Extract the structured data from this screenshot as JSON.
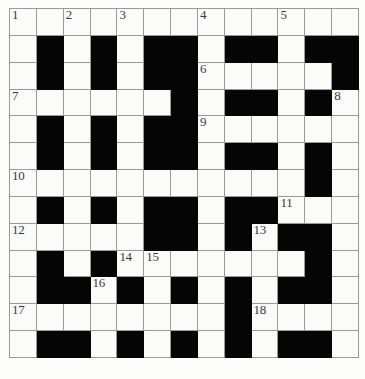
{
  "diagram": {
    "kind": "crossword-grid",
    "columns": 13,
    "rows": 13,
    "colors": {
      "block": "#050505",
      "cell": "#fbfbfa",
      "grid_line": "#9a9a9a",
      "number_text": "#3a3a3a",
      "page_background": "#ffffff"
    },
    "legend": {
      "block_label": "blocked square",
      "open_label": "open square"
    },
    "clue_numbers": [
      1,
      2,
      3,
      4,
      5,
      6,
      7,
      8,
      9,
      10,
      11,
      12,
      13,
      14,
      15,
      16,
      17,
      18
    ],
    "cells": [
      [
        {
          "block": false,
          "num": "1"
        },
        {
          "block": false,
          "num": ""
        },
        {
          "block": false,
          "num": "2"
        },
        {
          "block": false,
          "num": ""
        },
        {
          "block": false,
          "num": "3"
        },
        {
          "block": false,
          "num": ""
        },
        {
          "block": false,
          "num": ""
        },
        {
          "block": false,
          "num": "4"
        },
        {
          "block": false,
          "num": ""
        },
        {
          "block": false,
          "num": ""
        },
        {
          "block": false,
          "num": "5"
        },
        {
          "block": false,
          "num": ""
        },
        {
          "block": false,
          "num": ""
        }
      ],
      [
        {
          "block": false,
          "num": ""
        },
        {
          "block": true,
          "num": ""
        },
        {
          "block": false,
          "num": ""
        },
        {
          "block": true,
          "num": ""
        },
        {
          "block": false,
          "num": ""
        },
        {
          "block": true,
          "num": ""
        },
        {
          "block": true,
          "num": ""
        },
        {
          "block": false,
          "num": ""
        },
        {
          "block": true,
          "num": ""
        },
        {
          "block": true,
          "num": ""
        },
        {
          "block": false,
          "num": ""
        },
        {
          "block": true,
          "num": ""
        },
        {
          "block": true,
          "num": ""
        }
      ],
      [
        {
          "block": false,
          "num": ""
        },
        {
          "block": true,
          "num": ""
        },
        {
          "block": false,
          "num": ""
        },
        {
          "block": true,
          "num": ""
        },
        {
          "block": false,
          "num": ""
        },
        {
          "block": true,
          "num": ""
        },
        {
          "block": true,
          "num": ""
        },
        {
          "block": false,
          "num": "6"
        },
        {
          "block": false,
          "num": ""
        },
        {
          "block": false,
          "num": ""
        },
        {
          "block": false,
          "num": ""
        },
        {
          "block": false,
          "num": ""
        },
        {
          "block": true,
          "num": ""
        }
      ],
      [
        {
          "block": false,
          "num": "7"
        },
        {
          "block": false,
          "num": ""
        },
        {
          "block": false,
          "num": ""
        },
        {
          "block": false,
          "num": ""
        },
        {
          "block": false,
          "num": ""
        },
        {
          "block": false,
          "num": ""
        },
        {
          "block": true,
          "num": ""
        },
        {
          "block": false,
          "num": ""
        },
        {
          "block": true,
          "num": ""
        },
        {
          "block": true,
          "num": ""
        },
        {
          "block": false,
          "num": ""
        },
        {
          "block": true,
          "num": ""
        },
        {
          "block": false,
          "num": "8"
        }
      ],
      [
        {
          "block": false,
          "num": ""
        },
        {
          "block": true,
          "num": ""
        },
        {
          "block": false,
          "num": ""
        },
        {
          "block": true,
          "num": ""
        },
        {
          "block": false,
          "num": ""
        },
        {
          "block": true,
          "num": ""
        },
        {
          "block": true,
          "num": ""
        },
        {
          "block": false,
          "num": "9"
        },
        {
          "block": false,
          "num": ""
        },
        {
          "block": false,
          "num": ""
        },
        {
          "block": false,
          "num": ""
        },
        {
          "block": false,
          "num": ""
        },
        {
          "block": false,
          "num": ""
        }
      ],
      [
        {
          "block": false,
          "num": ""
        },
        {
          "block": true,
          "num": ""
        },
        {
          "block": false,
          "num": ""
        },
        {
          "block": true,
          "num": ""
        },
        {
          "block": false,
          "num": ""
        },
        {
          "block": true,
          "num": ""
        },
        {
          "block": true,
          "num": ""
        },
        {
          "block": false,
          "num": ""
        },
        {
          "block": true,
          "num": ""
        },
        {
          "block": true,
          "num": ""
        },
        {
          "block": false,
          "num": ""
        },
        {
          "block": true,
          "num": ""
        },
        {
          "block": false,
          "num": ""
        }
      ],
      [
        {
          "block": false,
          "num": "10"
        },
        {
          "block": false,
          "num": ""
        },
        {
          "block": false,
          "num": ""
        },
        {
          "block": false,
          "num": ""
        },
        {
          "block": false,
          "num": ""
        },
        {
          "block": false,
          "num": ""
        },
        {
          "block": false,
          "num": ""
        },
        {
          "block": false,
          "num": ""
        },
        {
          "block": false,
          "num": ""
        },
        {
          "block": false,
          "num": ""
        },
        {
          "block": false,
          "num": ""
        },
        {
          "block": true,
          "num": ""
        },
        {
          "block": false,
          "num": ""
        }
      ],
      [
        {
          "block": false,
          "num": ""
        },
        {
          "block": true,
          "num": ""
        },
        {
          "block": false,
          "num": ""
        },
        {
          "block": true,
          "num": ""
        },
        {
          "block": false,
          "num": ""
        },
        {
          "block": true,
          "num": ""
        },
        {
          "block": true,
          "num": ""
        },
        {
          "block": false,
          "num": ""
        },
        {
          "block": true,
          "num": ""
        },
        {
          "block": true,
          "num": ""
        },
        {
          "block": false,
          "num": "11"
        },
        {
          "block": false,
          "num": ""
        },
        {
          "block": false,
          "num": ""
        }
      ],
      [
        {
          "block": false,
          "num": "12"
        },
        {
          "block": false,
          "num": ""
        },
        {
          "block": false,
          "num": ""
        },
        {
          "block": false,
          "num": ""
        },
        {
          "block": false,
          "num": ""
        },
        {
          "block": true,
          "num": ""
        },
        {
          "block": true,
          "num": ""
        },
        {
          "block": false,
          "num": ""
        },
        {
          "block": true,
          "num": ""
        },
        {
          "block": false,
          "num": "13"
        },
        {
          "block": true,
          "num": ""
        },
        {
          "block": true,
          "num": ""
        },
        {
          "block": false,
          "num": ""
        }
      ],
      [
        {
          "block": false,
          "num": ""
        },
        {
          "block": true,
          "num": ""
        },
        {
          "block": false,
          "num": ""
        },
        {
          "block": true,
          "num": ""
        },
        {
          "block": false,
          "num": "14"
        },
        {
          "block": false,
          "num": "15"
        },
        {
          "block": false,
          "num": ""
        },
        {
          "block": false,
          "num": ""
        },
        {
          "block": false,
          "num": ""
        },
        {
          "block": false,
          "num": ""
        },
        {
          "block": false,
          "num": ""
        },
        {
          "block": true,
          "num": ""
        },
        {
          "block": false,
          "num": ""
        }
      ],
      [
        {
          "block": false,
          "num": ""
        },
        {
          "block": true,
          "num": ""
        },
        {
          "block": true,
          "num": ""
        },
        {
          "block": false,
          "num": "16"
        },
        {
          "block": true,
          "num": ""
        },
        {
          "block": false,
          "num": ""
        },
        {
          "block": true,
          "num": ""
        },
        {
          "block": false,
          "num": ""
        },
        {
          "block": true,
          "num": ""
        },
        {
          "block": false,
          "num": ""
        },
        {
          "block": true,
          "num": ""
        },
        {
          "block": true,
          "num": ""
        },
        {
          "block": false,
          "num": ""
        }
      ],
      [
        {
          "block": false,
          "num": "17"
        },
        {
          "block": false,
          "num": ""
        },
        {
          "block": false,
          "num": ""
        },
        {
          "block": false,
          "num": ""
        },
        {
          "block": false,
          "num": ""
        },
        {
          "block": false,
          "num": ""
        },
        {
          "block": false,
          "num": ""
        },
        {
          "block": false,
          "num": ""
        },
        {
          "block": true,
          "num": ""
        },
        {
          "block": false,
          "num": "18"
        },
        {
          "block": false,
          "num": ""
        },
        {
          "block": false,
          "num": ""
        },
        {
          "block": false,
          "num": ""
        }
      ],
      [
        {
          "block": false,
          "num": ""
        },
        {
          "block": true,
          "num": ""
        },
        {
          "block": true,
          "num": ""
        },
        {
          "block": false,
          "num": ""
        },
        {
          "block": true,
          "num": ""
        },
        {
          "block": false,
          "num": ""
        },
        {
          "block": true,
          "num": ""
        },
        {
          "block": false,
          "num": ""
        },
        {
          "block": true,
          "num": ""
        },
        {
          "block": false,
          "num": ""
        },
        {
          "block": true,
          "num": ""
        },
        {
          "block": true,
          "num": ""
        },
        {
          "block": false,
          "num": ""
        }
      ]
    ]
  }
}
